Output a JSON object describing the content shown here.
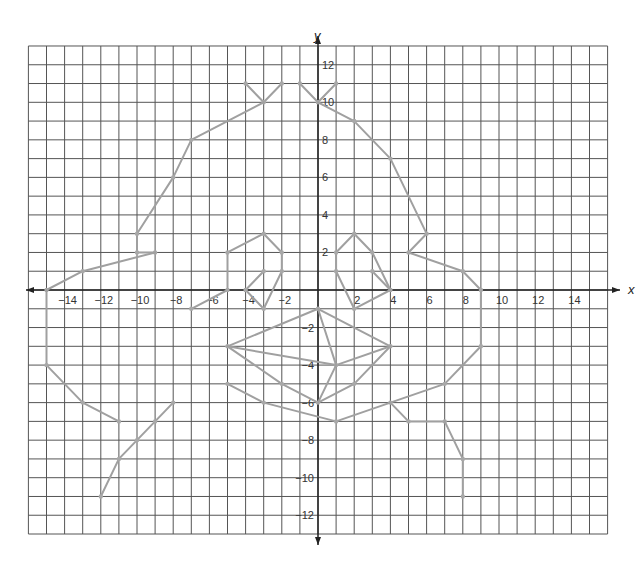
{
  "diagram": {
    "type": "coordinate-grid-drawing",
    "axes": {
      "x_label": "x",
      "y_label": "y",
      "x_range": [
        -16,
        16
      ],
      "y_range": [
        -13,
        13
      ],
      "x_ticks": [
        -14,
        -12,
        -10,
        -8,
        -6,
        -4,
        -2,
        2,
        4,
        6,
        8,
        10,
        12,
        14
      ],
      "y_ticks": [
        12,
        10,
        8,
        6,
        4,
        2,
        -2,
        -4,
        -6,
        -8,
        -10,
        -12
      ],
      "grid": true,
      "grid_step": 1
    },
    "colors": {
      "grid": "#555555",
      "axis": "#222222",
      "shape": "#a0a0a0",
      "point": "#a8a8a8",
      "background": "#ffffff"
    },
    "polylines": [
      {
        "name": "ear-left",
        "points": [
          [
            -4,
            11
          ],
          [
            -3,
            10
          ],
          [
            -2,
            11
          ]
        ]
      },
      {
        "name": "ear-right",
        "points": [
          [
            -1,
            11
          ],
          [
            0,
            10
          ],
          [
            1,
            11
          ]
        ]
      },
      {
        "name": "head-outline-left",
        "points": [
          [
            -3,
            10
          ],
          [
            -7,
            8
          ],
          [
            -8,
            6
          ],
          [
            -10,
            3
          ],
          [
            -10,
            2
          ],
          [
            -9,
            2
          ]
        ]
      },
      {
        "name": "arm-left-top",
        "points": [
          [
            -15,
            0
          ],
          [
            -13,
            1
          ],
          [
            -9,
            2
          ]
        ]
      },
      {
        "name": "head-outline-right",
        "points": [
          [
            0,
            10
          ],
          [
            2,
            9
          ],
          [
            4,
            7
          ],
          [
            6,
            3
          ],
          [
            5,
            2
          ],
          [
            8,
            1
          ],
          [
            9,
            0
          ],
          [
            9,
            -3
          ],
          [
            7,
            -5
          ],
          [
            4,
            -6
          ],
          [
            5,
            -7
          ],
          [
            7,
            -7
          ]
        ]
      },
      {
        "name": "leg-right",
        "points": [
          [
            7,
            -7
          ],
          [
            8,
            -9
          ],
          [
            8,
            -11
          ]
        ]
      },
      {
        "name": "arm-left-bottom",
        "points": [
          [
            -15,
            0
          ],
          [
            -15,
            -4
          ],
          [
            -13,
            -6
          ],
          [
            -11,
            -7
          ]
        ]
      },
      {
        "name": "leg-left",
        "points": [
          [
            -8,
            -6
          ],
          [
            -9,
            -7
          ],
          [
            -10,
            -8
          ],
          [
            -11,
            -9
          ],
          [
            -12,
            -11
          ]
        ]
      },
      {
        "name": "eye-left-outer",
        "points": [
          [
            -7,
            -1
          ],
          [
            -5,
            0
          ],
          [
            -5,
            2
          ],
          [
            -3,
            3
          ],
          [
            -2,
            2
          ],
          [
            -2,
            1
          ],
          [
            -3,
            -1
          ],
          [
            -4,
            0
          ],
          [
            -3,
            1
          ]
        ]
      },
      {
        "name": "eye-right-outer",
        "points": [
          [
            1,
            1
          ],
          [
            1,
            2
          ],
          [
            2,
            3
          ],
          [
            3,
            2
          ],
          [
            4,
            0
          ],
          [
            2,
            -1
          ],
          [
            1,
            1
          ]
        ]
      },
      {
        "name": "eye-right-inner",
        "points": [
          [
            3,
            1
          ],
          [
            4,
            0
          ]
        ]
      },
      {
        "name": "snout-outline",
        "points": [
          [
            -5,
            -3
          ],
          [
            0,
            -1
          ],
          [
            4,
            -3
          ],
          [
            2,
            -5
          ],
          [
            0,
            -6
          ],
          [
            -2,
            -5
          ],
          [
            -5,
            -3
          ]
        ]
      },
      {
        "name": "snout-inner",
        "points": [
          [
            -5,
            -3
          ],
          [
            1,
            -4
          ],
          [
            4,
            -3
          ]
        ]
      },
      {
        "name": "snout-center",
        "points": [
          [
            0,
            -1
          ],
          [
            1,
            -4
          ],
          [
            0,
            -6
          ]
        ]
      },
      {
        "name": "chin",
        "points": [
          [
            -5,
            -5
          ],
          [
            -3,
            -6
          ],
          [
            1,
            -7
          ],
          [
            4,
            -6
          ]
        ]
      }
    ]
  }
}
